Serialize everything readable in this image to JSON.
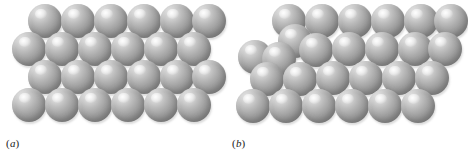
{
  "figure": {
    "background_color": "#ffffff",
    "width": 452,
    "height": 153
  },
  "atom_style": {
    "fill_color": "#9b9b9b",
    "highlight_color": "#f2f2f2",
    "shadow_color": "#868686",
    "diameter": 34,
    "highlight_position": "upper-left"
  },
  "panels": [
    {
      "id": "a",
      "label_open": "(",
      "label_letter": "a",
      "label_close": ")",
      "label": "(a)",
      "description": "Perfect crystal lattice - regular close packed rows of atoms",
      "row_count": 4,
      "atoms_per_row": 6,
      "defect": "none",
      "atoms": [
        {
          "x": 28,
          "y": 4,
          "d": 34
        },
        {
          "x": 61,
          "y": 4,
          "d": 34
        },
        {
          "x": 94,
          "y": 4,
          "d": 34
        },
        {
          "x": 127,
          "y": 4,
          "d": 34
        },
        {
          "x": 160,
          "y": 4,
          "d": 34
        },
        {
          "x": 192,
          "y": 4,
          "d": 34
        },
        {
          "x": 12,
          "y": 32,
          "d": 34
        },
        {
          "x": 45,
          "y": 32,
          "d": 34
        },
        {
          "x": 78,
          "y": 32,
          "d": 34
        },
        {
          "x": 111,
          "y": 32,
          "d": 34
        },
        {
          "x": 144,
          "y": 32,
          "d": 34
        },
        {
          "x": 177,
          "y": 32,
          "d": 34
        },
        {
          "x": 28,
          "y": 60,
          "d": 34
        },
        {
          "x": 61,
          "y": 60,
          "d": 34
        },
        {
          "x": 94,
          "y": 60,
          "d": 34
        },
        {
          "x": 127,
          "y": 60,
          "d": 34
        },
        {
          "x": 160,
          "y": 60,
          "d": 34
        },
        {
          "x": 192,
          "y": 60,
          "d": 34
        },
        {
          "x": 12,
          "y": 88,
          "d": 34
        },
        {
          "x": 45,
          "y": 88,
          "d": 34
        },
        {
          "x": 78,
          "y": 88,
          "d": 34
        },
        {
          "x": 111,
          "y": 88,
          "d": 34
        },
        {
          "x": 144,
          "y": 88,
          "d": 34
        },
        {
          "x": 177,
          "y": 88,
          "d": 34
        }
      ]
    },
    {
      "id": "b",
      "label_open": "(",
      "label_letter": "b",
      "label_close": ")",
      "label": "(b)",
      "description": "Crystal containing an edge dislocation - extra half plane of atoms at upper left",
      "row_count": 4,
      "atoms_per_row": 6,
      "defect": "edge-dislocation",
      "atoms": [
        {
          "x": 46,
          "y": 4,
          "d": 34
        },
        {
          "x": 79,
          "y": 4,
          "d": 34
        },
        {
          "x": 112,
          "y": 4,
          "d": 34
        },
        {
          "x": 145,
          "y": 4,
          "d": 34
        },
        {
          "x": 178,
          "y": 4,
          "d": 34
        },
        {
          "x": 208,
          "y": 4,
          "d": 34
        },
        {
          "x": 52,
          "y": 24,
          "d": 34
        },
        {
          "x": 12,
          "y": 40,
          "d": 34
        },
        {
          "x": 36,
          "y": 42,
          "d": 34
        },
        {
          "x": 73,
          "y": 33,
          "d": 34
        },
        {
          "x": 106,
          "y": 32,
          "d": 34
        },
        {
          "x": 139,
          "y": 32,
          "d": 34
        },
        {
          "x": 172,
          "y": 32,
          "d": 34
        },
        {
          "x": 202,
          "y": 32,
          "d": 34
        },
        {
          "x": 24,
          "y": 62,
          "d": 34
        },
        {
          "x": 57,
          "y": 62,
          "d": 34
        },
        {
          "x": 90,
          "y": 61,
          "d": 34
        },
        {
          "x": 123,
          "y": 61,
          "d": 34
        },
        {
          "x": 156,
          "y": 61,
          "d": 34
        },
        {
          "x": 189,
          "y": 61,
          "d": 34
        },
        {
          "x": 10,
          "y": 89,
          "d": 34
        },
        {
          "x": 43,
          "y": 89,
          "d": 34
        },
        {
          "x": 76,
          "y": 89,
          "d": 34
        },
        {
          "x": 109,
          "y": 89,
          "d": 34
        },
        {
          "x": 142,
          "y": 89,
          "d": 34
        },
        {
          "x": 175,
          "y": 89,
          "d": 34
        }
      ]
    }
  ]
}
